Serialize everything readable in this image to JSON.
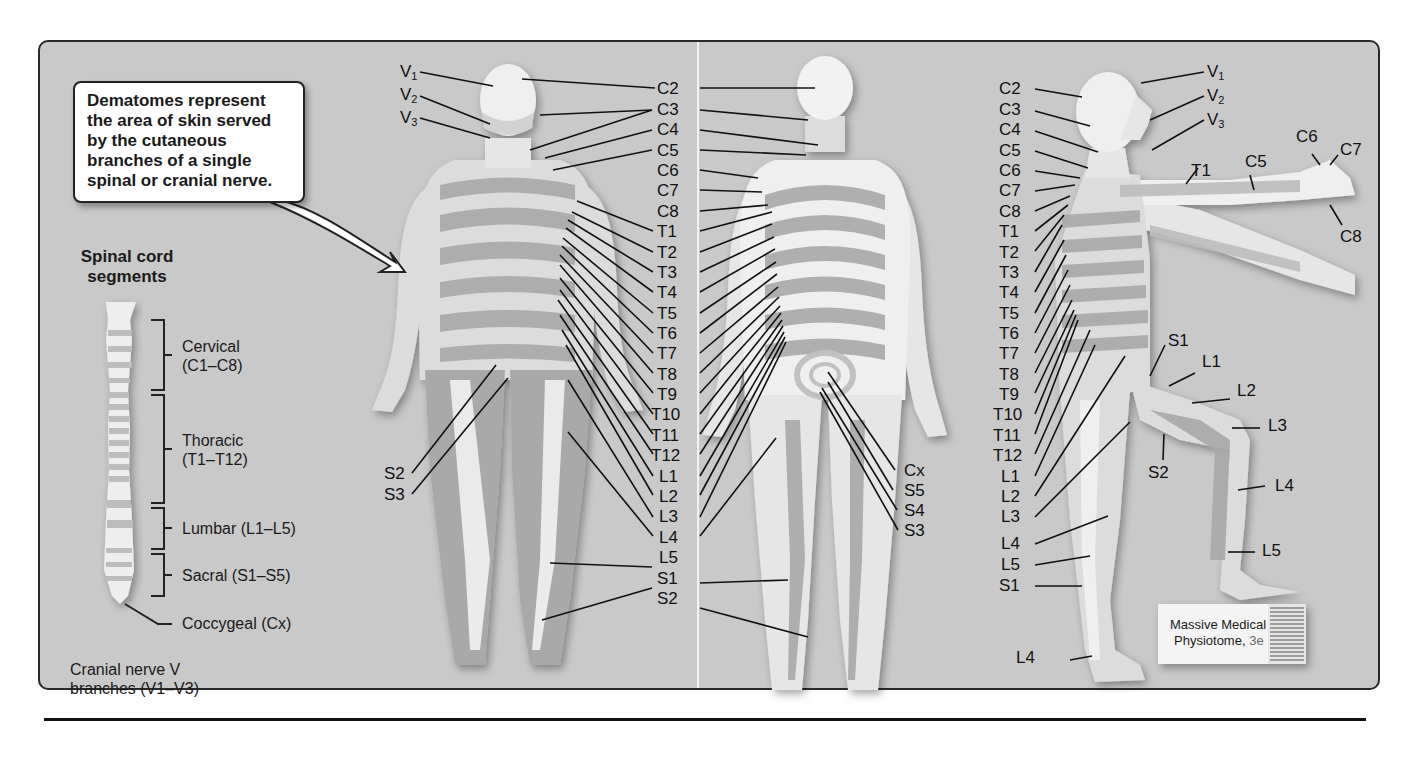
{
  "callout": {
    "text": "Dematomes represent the area of skin served by the cutaneous branches of a single spinal or cranial nerve."
  },
  "spinal_cord": {
    "title": "Spinal cord segments",
    "regions": [
      {
        "name": "Cervical",
        "range": "(C1–C8)"
      },
      {
        "name": "Thoracic",
        "range": "(T1–T12)"
      },
      {
        "name": "Lumbar",
        "range": "(L1–L5)"
      },
      {
        "name": "Sacral",
        "range": "(S1–S5)"
      },
      {
        "name": "Coccygeal",
        "range": "(Cx)"
      }
    ],
    "cranial_note_line1": "Cranial nerve V",
    "cranial_note_line2": "branches (V1–V3)"
  },
  "anterior_view": {
    "left_labels": [
      "V1",
      "V2",
      "V3",
      "S2",
      "S3"
    ]
  },
  "center_column_labels": [
    "C2",
    "C3",
    "C4",
    "C5",
    "C6",
    "C7",
    "C8",
    "T1",
    "T2",
    "T3",
    "T4",
    "T5",
    "T6",
    "T7",
    "T8",
    "T9",
    "T10",
    "T11",
    "T12",
    "L1",
    "L2",
    "L3",
    "L4",
    "L5",
    "S1",
    "S2"
  ],
  "posterior_view": {
    "right_labels": [
      "Cx",
      "S5",
      "S4",
      "S3"
    ]
  },
  "lateral_view": {
    "left_column_labels": [
      "C2",
      "C3",
      "C4",
      "C5",
      "C6",
      "C7",
      "C8",
      "T1",
      "T2",
      "T3",
      "T4",
      "T5",
      "T6",
      "T7",
      "T8",
      "T9",
      "T10",
      "T11",
      "T12",
      "L1",
      "L2",
      "L3",
      "L4",
      "L5",
      "S1"
    ],
    "head_labels": [
      "V1",
      "V2",
      "V3"
    ],
    "arm_labels": [
      "C6",
      "C7",
      "C5",
      "T1",
      "C8"
    ],
    "leg_labels": [
      "S1",
      "L1",
      "L2",
      "L3",
      "S2",
      "L4",
      "L5"
    ],
    "foot_label": "L4"
  },
  "book": {
    "title_line1": "Massive Medical",
    "title_line2": "Physiotome,",
    "edition": "3e"
  },
  "colors": {
    "background": "#c9c9c9",
    "skin_light": "#f2f2f2",
    "skin_mid": "#dcdcdc",
    "skin_dark": "#a9a9a9",
    "line": "#111111"
  }
}
